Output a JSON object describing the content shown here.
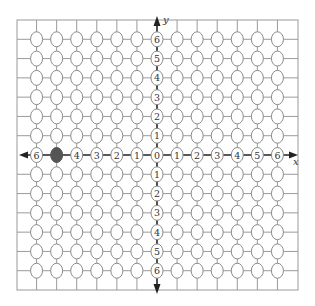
{
  "diagram": {
    "type": "coordinate-grid",
    "x_axis": {
      "label": "x",
      "tick_labels_left": [
        "6",
        "5",
        "4",
        "3",
        "2",
        "1"
      ],
      "tick_labels_right": [
        "1",
        "2",
        "3",
        "4",
        "5",
        "6"
      ],
      "origin_label": "0"
    },
    "y_axis": {
      "label": "y",
      "tick_labels_up": [
        "1",
        "2",
        "3",
        "4",
        "5",
        "6"
      ],
      "tick_labels_down": [
        "1",
        "2",
        "3",
        "4",
        "5",
        "6"
      ]
    },
    "grid": {
      "min": -7,
      "max": 7,
      "node_min": -6,
      "node_max": 6
    },
    "highlighted_point": {
      "x": -5,
      "y": 0,
      "fill": "#555555"
    },
    "colors": {
      "grid_line": "#9a9a9a",
      "node_stroke": "#8a8a8a",
      "axis": "#222222",
      "node_fill": "#ffffff",
      "label": "#333333"
    }
  }
}
